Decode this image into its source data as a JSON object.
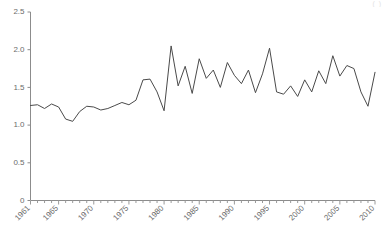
{
  "chart_data": {
    "type": "line",
    "title": "",
    "subtitle": "",
    "xlabel": "",
    "ylabel": "",
    "xlim": [
      1961,
      2010
    ],
    "ylim": [
      0,
      2.5
    ],
    "grid": false,
    "legend": false,
    "legend_position": "none",
    "y_ticks": [
      "0",
      "0.5",
      "1.0",
      "1.5",
      "2.0",
      "2.5"
    ],
    "y_tick_values": [
      0,
      0.5,
      1.0,
      1.5,
      2.0,
      2.5
    ],
    "x_ticks": [
      "1961",
      "1965",
      "1970",
      "1975",
      "1980",
      "1985",
      "1990",
      "1995",
      "2000",
      "2005",
      "2010"
    ],
    "x_tick_values": [
      1961,
      1965,
      1970,
      1975,
      1980,
      1985,
      1990,
      1995,
      2000,
      2005,
      2010
    ],
    "x": [
      1961,
      1962,
      1963,
      1964,
      1965,
      1966,
      1967,
      1968,
      1969,
      1970,
      1971,
      1972,
      1973,
      1974,
      1975,
      1976,
      1977,
      1978,
      1979,
      1980,
      1981,
      1982,
      1983,
      1984,
      1985,
      1986,
      1987,
      1988,
      1989,
      1990,
      1991,
      1992,
      1993,
      1994,
      1995,
      1996,
      1997,
      1998,
      1999,
      2000,
      2001,
      2002,
      2003,
      2004,
      2005,
      2006,
      2007,
      2008,
      2009,
      2010
    ],
    "values": [
      1.26,
      1.27,
      1.22,
      1.28,
      1.24,
      1.08,
      1.05,
      1.18,
      1.25,
      1.24,
      1.2,
      1.22,
      1.26,
      1.3,
      1.27,
      1.33,
      1.6,
      1.61,
      1.44,
      1.19,
      2.05,
      1.52,
      1.78,
      1.42,
      1.88,
      1.62,
      1.73,
      1.5,
      1.83,
      1.66,
      1.55,
      1.73,
      1.43,
      1.68,
      2.02,
      1.44,
      1.41,
      1.52,
      1.38,
      1.6,
      1.44,
      1.72,
      1.55,
      1.92,
      1.65,
      1.79,
      1.75,
      1.44,
      1.25,
      1.7
    ],
    "series": [
      {
        "name": "series-1",
        "color": "#4a4a4a",
        "values": [
          1.26,
          1.27,
          1.22,
          1.28,
          1.24,
          1.08,
          1.05,
          1.18,
          1.25,
          1.24,
          1.2,
          1.22,
          1.26,
          1.3,
          1.27,
          1.33,
          1.6,
          1.61,
          1.44,
          1.19,
          2.05,
          1.52,
          1.78,
          1.42,
          1.88,
          1.62,
          1.73,
          1.5,
          1.83,
          1.66,
          1.55,
          1.73,
          1.43,
          1.68,
          2.02,
          1.44,
          1.41,
          1.52,
          1.38,
          1.6,
          1.44,
          1.72,
          1.55,
          1.92,
          1.65,
          1.79,
          1.75,
          1.44,
          1.25,
          1.7
        ]
      }
    ]
  },
  "annotations": {
    "corner_fragment": "( )"
  },
  "colors": {
    "line": "#4a4a4a",
    "axis": "#8c8c8c",
    "tick_text": "#6b6b6b",
    "background": "#ffffff"
  }
}
